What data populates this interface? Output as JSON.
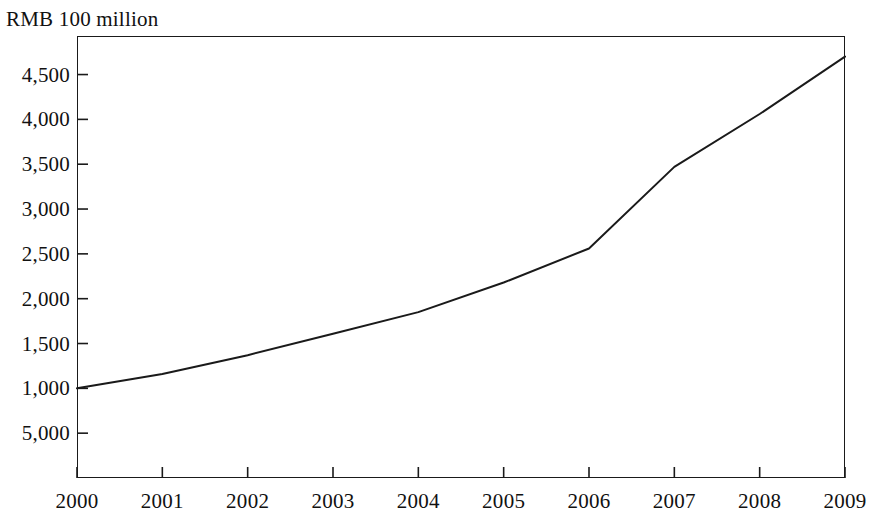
{
  "figure": {
    "y_axis_title": "RMB 100 million"
  },
  "chart_data": {
    "type": "line",
    "title": "",
    "subtitle": "",
    "xlabel": "",
    "ylabel": "RMB 100 million",
    "grid": false,
    "legend": null,
    "legend_position": "none",
    "line_color": "#1a1a1a",
    "background_color": "#ffffff",
    "frame_color": "#1a1a1a",
    "categories": [
      "2000",
      "2001",
      "2002",
      "2003",
      "2004",
      "2005",
      "2006",
      "2007",
      "2008",
      "2009"
    ],
    "x": [
      2000,
      2001,
      2002,
      2003,
      2004,
      2005,
      2006,
      2007,
      2008,
      2009
    ],
    "values": [
      1000,
      1160,
      1370,
      1610,
      1850,
      2180,
      2560,
      3470,
      4060,
      4700
    ],
    "series": [
      {
        "name": "",
        "values": [
          1000,
          1160,
          1370,
          1610,
          1850,
          2180,
          2560,
          3470,
          4060,
          4700
        ]
      }
    ],
    "xlim": [
      2000,
      2009
    ],
    "ylim": [
      0,
      4930
    ],
    "x_tick_labels": [
      "2000",
      "2001",
      "2002",
      "2003",
      "2004",
      "2005",
      "2006",
      "2007",
      "2008",
      "2009"
    ],
    "y_tick_values": [
      500,
      1000,
      1500,
      2000,
      2500,
      3000,
      3500,
      4000,
      4500
    ],
    "y_tick_labels": [
      "5,000",
      "1,000",
      "1,500",
      "2,000",
      "2,500",
      "3,000",
      "3,500",
      "4,000",
      "4,500"
    ]
  }
}
